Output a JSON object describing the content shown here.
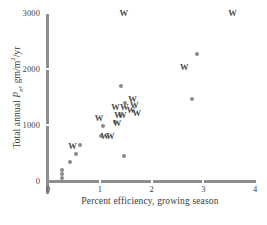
{
  "chart_data": {
    "type": "scatter",
    "title": "",
    "xlabel": "Percent efficiency, growing season",
    "ylabel": "Total annual P_n, gm/m2/yr",
    "ylabel_parts": {
      "prefix": "Total annual ",
      "symbol": "P",
      "subscript": "n",
      "units": ", gm/m",
      "exponent": "2",
      "suffix": "/yr"
    },
    "xlim": [
      0,
      4
    ],
    "ylim": [
      0,
      3000
    ],
    "xticks": [
      "0",
      "1",
      "2",
      "3",
      "4"
    ],
    "xtick_values": [
      0,
      1,
      2,
      3,
      4
    ],
    "yticks": [
      "0",
      "1000",
      "2000",
      "3000"
    ],
    "ytick_values": [
      0,
      1000,
      2000,
      3000
    ],
    "grid": false,
    "legend": "none",
    "series": [
      {
        "name": "circle-markers",
        "marker": "filled-circle",
        "color": "#8b8b8b",
        "points": [
          {
            "x": 0.27,
            "y": 200
          },
          {
            "x": 0.27,
            "y": 120
          },
          {
            "x": 0.28,
            "y": 60
          },
          {
            "x": 0.42,
            "y": 340
          },
          {
            "x": 0.55,
            "y": 490
          },
          {
            "x": 0.62,
            "y": 650
          },
          {
            "x": 1.02,
            "y": 800
          },
          {
            "x": 1.07,
            "y": 975
          },
          {
            "x": 1.3,
            "y": 1045
          },
          {
            "x": 1.42,
            "y": 1700
          },
          {
            "x": 1.49,
            "y": 1400
          },
          {
            "x": 1.47,
            "y": 450
          },
          {
            "x": 2.78,
            "y": 1470
          },
          {
            "x": 2.88,
            "y": 2265
          }
        ]
      },
      {
        "name": "W-markers",
        "marker": "letter-W",
        "color": "#4a4a4a",
        "points": [
          {
            "x": 0.46,
            "y": 610
          },
          {
            "x": 0.97,
            "y": 1120
          },
          {
            "x": 1.08,
            "y": 790
          },
          {
            "x": 1.19,
            "y": 790
          },
          {
            "x": 1.29,
            "y": 1310
          },
          {
            "x": 1.32,
            "y": 1025
          },
          {
            "x": 1.35,
            "y": 1165
          },
          {
            "x": 1.42,
            "y": 1165
          },
          {
            "x": 1.46,
            "y": 1320
          },
          {
            "x": 1.59,
            "y": 1265
          },
          {
            "x": 1.62,
            "y": 1450
          },
          {
            "x": 1.65,
            "y": 1340
          },
          {
            "x": 1.7,
            "y": 1210
          },
          {
            "x": 1.45,
            "y": 3000
          },
          {
            "x": 2.62,
            "y": 2020
          },
          {
            "x": 3.55,
            "y": 3000
          }
        ]
      }
    ]
  }
}
